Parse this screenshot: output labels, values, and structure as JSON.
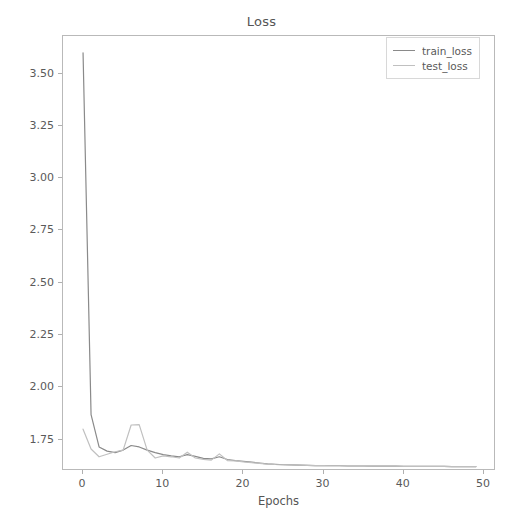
{
  "chart_data": {
    "type": "line",
    "title": "Loss",
    "xlabel": "Epochs",
    "ylabel": "",
    "xlim": [
      -2.5,
      51.5
    ],
    "ylim": [
      1.6,
      3.68
    ],
    "xticks": [
      0,
      10,
      20,
      30,
      40,
      50
    ],
    "yticks": [
      1.75,
      2.0,
      2.25,
      2.5,
      2.75,
      3.0,
      3.25,
      3.5
    ],
    "ytick_labels": [
      "1.75",
      "2.00",
      "2.25",
      "2.50",
      "2.75",
      "3.00",
      "3.25",
      "3.50"
    ],
    "xtick_labels": [
      "0",
      "10",
      "20",
      "30",
      "40",
      "50"
    ],
    "grid": false,
    "legend_position": "upper right",
    "x": [
      0,
      1,
      2,
      3,
      4,
      5,
      6,
      7,
      8,
      9,
      10,
      11,
      12,
      13,
      14,
      15,
      16,
      17,
      18,
      19,
      20,
      21,
      22,
      23,
      24,
      25,
      26,
      27,
      28,
      29,
      30,
      31,
      32,
      33,
      34,
      35,
      36,
      37,
      38,
      39,
      40,
      41,
      42,
      43,
      44,
      45,
      46,
      47,
      48,
      49
    ],
    "series": [
      {
        "name": "train_loss",
        "color": "#8a8a8a",
        "values": [
          3.6,
          1.87,
          1.715,
          1.695,
          1.688,
          1.7,
          1.722,
          1.715,
          1.7,
          1.688,
          1.678,
          1.672,
          1.668,
          1.678,
          1.67,
          1.66,
          1.658,
          1.668,
          1.655,
          1.65,
          1.646,
          1.642,
          1.638,
          1.634,
          1.632,
          1.63,
          1.629,
          1.628,
          1.627,
          1.626,
          1.626,
          1.625,
          1.625,
          1.624,
          1.624,
          1.624,
          1.623,
          1.623,
          1.623,
          1.623,
          1.622,
          1.622,
          1.622,
          1.622,
          1.622,
          1.622,
          1.621,
          1.621,
          1.621,
          1.621
        ]
      },
      {
        "name": "test_loss",
        "color": "#c0c0c0",
        "values": [
          1.8,
          1.705,
          1.668,
          1.68,
          1.692,
          1.7,
          1.82,
          1.822,
          1.7,
          1.662,
          1.672,
          1.668,
          1.662,
          1.69,
          1.662,
          1.656,
          1.652,
          1.682,
          1.65,
          1.648,
          1.644,
          1.64,
          1.636,
          1.633,
          1.631,
          1.63,
          1.629,
          1.628,
          1.627,
          1.626,
          1.626,
          1.625,
          1.625,
          1.624,
          1.624,
          1.624,
          1.623,
          1.623,
          1.623,
          1.623,
          1.622,
          1.622,
          1.622,
          1.622,
          1.622,
          1.622,
          1.621,
          1.621,
          1.621,
          1.621
        ]
      }
    ]
  },
  "legend": {
    "items": [
      {
        "label": "train_loss"
      },
      {
        "label": "test_loss"
      }
    ]
  },
  "colors": {
    "train_loss": "#8a8a8a",
    "test_loss": "#c0c0c0",
    "axis": "#b9b9b9",
    "text": "#555555"
  }
}
